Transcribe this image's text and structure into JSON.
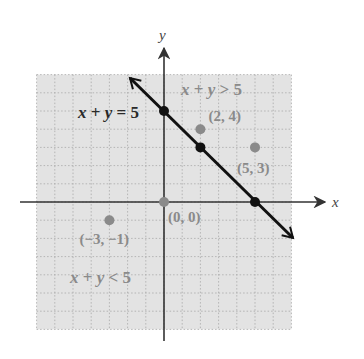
{
  "figure": {
    "axes": {
      "x_label": "x",
      "y_label": "y"
    },
    "colors": {
      "shade": "#e3e3e3",
      "grid": "#a8a8a8",
      "axis": "#333333",
      "boundary_line": "#111111",
      "test_points": "#8a8a8a",
      "label_gray": "#8a8a8a"
    },
    "grid": {
      "xmin": -7,
      "xmax": 7,
      "ymin": -7,
      "ymax": 7,
      "step": 1
    },
    "labels": {
      "equation": {
        "lhs_x": "x",
        "plus": " + ",
        "lhs_y": "y",
        "rhs": " = 5"
      },
      "greater": {
        "lhs_x": "x",
        "plus": " + ",
        "lhs_y": "y",
        "rhs": " > 5"
      },
      "less": {
        "lhs_x": "x",
        "plus": " + ",
        "lhs_y": "y",
        "rhs": " < 5"
      }
    },
    "line": {
      "equation": "x + y = 5",
      "points_on_line": [
        [
          0,
          5
        ],
        [
          2,
          3
        ],
        [
          5,
          0
        ]
      ]
    },
    "test_points": [
      {
        "x": 2,
        "y": 4,
        "label": "(2, 4)"
      },
      {
        "x": 5,
        "y": 3,
        "label": "(5, 3)"
      },
      {
        "x": 0,
        "y": 0,
        "label": "(0, 0)"
      },
      {
        "x": -3,
        "y": -1,
        "label": "(−3, −1)"
      }
    ]
  },
  "chart_data": {
    "type": "line",
    "title": "",
    "xlabel": "x",
    "ylabel": "y",
    "xlim": [
      -7,
      7
    ],
    "ylim": [
      -7,
      7
    ],
    "grid": true,
    "series": [
      {
        "name": "x + y = 5",
        "x": [
          -4,
          0,
          2,
          5,
          7
        ],
        "y": [
          9,
          5,
          3,
          0,
          -2
        ],
        "style": "solid-black-bidirectional-arrow"
      }
    ],
    "points": [
      {
        "x": 0,
        "y": 5,
        "label": "",
        "color": "black"
      },
      {
        "x": 2,
        "y": 3,
        "label": "",
        "color": "black"
      },
      {
        "x": 5,
        "y": 0,
        "label": "",
        "color": "black"
      },
      {
        "x": 2,
        "y": 4,
        "label": "(2, 4)",
        "color": "gray"
      },
      {
        "x": 5,
        "y": 3,
        "label": "(5, 3)",
        "color": "gray"
      },
      {
        "x": 0,
        "y": 0,
        "label": "(0, 0)",
        "color": "gray"
      },
      {
        "x": -3,
        "y": -1,
        "label": "(−3, −1)",
        "color": "gray"
      }
    ],
    "annotations": [
      "x + y = 5",
      "x + y > 5",
      "x + y < 5"
    ]
  }
}
